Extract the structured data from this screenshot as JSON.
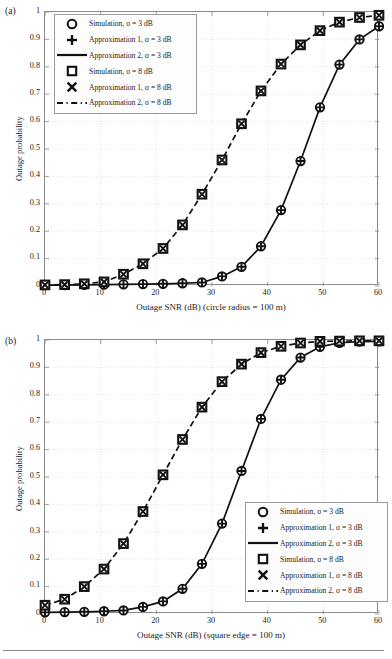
{
  "figure": {
    "width": 387,
    "height": 659,
    "background": "#ffffff",
    "line_color": "#111111",
    "grid_color": "#cfcfcf",
    "axis_color": "#8a8a8a",
    "footer_rule": true
  },
  "legend_entries": [
    {
      "marker": "circle-marker",
      "label": "Simulation, σ = 3 dB"
    },
    {
      "marker": "plus-marker",
      "label": "Approximation 1, σ = 3 dB"
    },
    {
      "marker": "solid-line-marker",
      "label": "Approximation 2, σ = 3 dB"
    },
    {
      "marker": "square-marker",
      "label": "Simulation, σ = 8 dB"
    },
    {
      "marker": "cross-marker",
      "label": "Approximation 1, σ = 8 dB"
    },
    {
      "marker": "dashed-line-marker",
      "label": "Approximation 2, σ = 8 dB"
    }
  ],
  "chart_data": [
    {
      "panel": "(a)",
      "type": "line",
      "title": "",
      "xlabel": "Outage SNR (dB) (circle radius = 100 m)",
      "ylabel": "Outage probability",
      "xlim": [
        0,
        60
      ],
      "ylim": [
        0,
        1
      ],
      "xticks": [
        0,
        10,
        20,
        30,
        40,
        50,
        60
      ],
      "yticks": [
        0,
        0.1,
        0.2,
        0.3,
        0.4,
        0.5,
        0.6,
        0.7,
        0.8,
        0.9,
        1
      ],
      "ytick_labels": [
        "0",
        "0.1",
        "0.2",
        "0.3",
        "0.4",
        "0.5",
        "0.6",
        "0.7",
        "0.8",
        "0.9",
        "1"
      ],
      "xtick_labels": [
        "0",
        "10",
        "20",
        "30",
        "40",
        "50",
        "60"
      ],
      "grid": true,
      "legend_position": "upper-left",
      "x": [
        0,
        3.53,
        7.06,
        10.6,
        14.1,
        17.6,
        21.2,
        24.7,
        28.2,
        31.8,
        35.3,
        38.8,
        42.4,
        45.9,
        49.4,
        52.9,
        56.5,
        60
      ],
      "series": [
        {
          "name": "Simulation, σ = 3 dB",
          "marker": "circle",
          "line": "solid",
          "values": [
            0.003,
            0.003,
            0.004,
            0.005,
            0.006,
            0.007,
            0.008,
            0.01,
            0.013,
            0.035,
            0.07,
            0.145,
            0.277,
            0.456,
            0.652,
            0.808,
            0.9,
            0.948
          ]
        },
        {
          "name": "Approximation 2, σ = 3 dB",
          "marker": "none",
          "line": "solid",
          "values": [
            0.003,
            0.003,
            0.004,
            0.005,
            0.006,
            0.007,
            0.008,
            0.01,
            0.013,
            0.035,
            0.07,
            0.145,
            0.277,
            0.456,
            0.652,
            0.808,
            0.9,
            0.948
          ]
        },
        {
          "name": "Simulation, σ = 8 dB",
          "marker": "square",
          "line": "dashed",
          "values": [
            0.004,
            0.005,
            0.008,
            0.015,
            0.043,
            0.081,
            0.137,
            0.223,
            0.335,
            0.46,
            0.592,
            0.712,
            0.81,
            0.88,
            0.932,
            0.963,
            0.98,
            0.988
          ]
        },
        {
          "name": "Approximation 2, σ = 8 dB",
          "marker": "none",
          "line": "dashed",
          "values": [
            0.004,
            0.005,
            0.008,
            0.015,
            0.043,
            0.081,
            0.137,
            0.223,
            0.335,
            0.46,
            0.592,
            0.712,
            0.81,
            0.88,
            0.932,
            0.963,
            0.98,
            0.988
          ]
        }
      ]
    },
    {
      "panel": "(b)",
      "type": "line",
      "title": "",
      "xlabel": "Outage SNR (dB) (square edge = 100 m)",
      "ylabel": "Outage probability",
      "xlim": [
        0,
        60
      ],
      "ylim": [
        0,
        1
      ],
      "xticks": [
        0,
        10,
        20,
        30,
        40,
        50,
        60
      ],
      "yticks": [
        0,
        0.1,
        0.2,
        0.3,
        0.4,
        0.5,
        0.6,
        0.7,
        0.8,
        0.9,
        1
      ],
      "ytick_labels": [
        "0",
        "0.1",
        "0.2",
        "0.3",
        "0.4",
        "0.5",
        "0.6",
        "0.7",
        "0.8",
        "0.9",
        "1"
      ],
      "xtick_labels": [
        "0",
        "10",
        "20",
        "30",
        "40",
        "50",
        "60"
      ],
      "grid": true,
      "legend_position": "lower-right",
      "x": [
        0,
        3.53,
        7.06,
        10.6,
        14.1,
        17.6,
        21.2,
        24.7,
        28.2,
        31.8,
        35.3,
        38.8,
        42.4,
        45.9,
        49.4,
        52.9,
        56.5,
        60
      ],
      "series": [
        {
          "name": "Simulation, σ = 3 dB",
          "marker": "circle",
          "line": "solid",
          "values": [
            0.006,
            0.007,
            0.008,
            0.01,
            0.013,
            0.026,
            0.046,
            0.092,
            0.183,
            0.33,
            0.522,
            0.712,
            0.855,
            0.936,
            0.975,
            0.99,
            0.994,
            0.995
          ]
        },
        {
          "name": "Approximation 2, σ = 3 dB",
          "marker": "none",
          "line": "solid",
          "values": [
            0.006,
            0.007,
            0.008,
            0.01,
            0.013,
            0.026,
            0.046,
            0.092,
            0.183,
            0.33,
            0.522,
            0.712,
            0.855,
            0.936,
            0.975,
            0.99,
            0.994,
            0.995
          ]
        },
        {
          "name": "Simulation, σ = 8 dB",
          "marker": "square",
          "line": "dashed",
          "values": [
            0.032,
            0.054,
            0.1,
            0.164,
            0.257,
            0.374,
            0.508,
            0.637,
            0.755,
            0.848,
            0.912,
            0.954,
            0.977,
            0.989,
            0.995,
            0.996,
            0.997,
            0.997
          ]
        },
        {
          "name": "Approximation 2, σ = 8 dB",
          "marker": "none",
          "line": "dashed",
          "values": [
            0.032,
            0.054,
            0.1,
            0.164,
            0.257,
            0.374,
            0.508,
            0.637,
            0.755,
            0.848,
            0.912,
            0.954,
            0.977,
            0.989,
            0.995,
            0.996,
            0.997,
            0.997
          ]
        }
      ]
    }
  ]
}
